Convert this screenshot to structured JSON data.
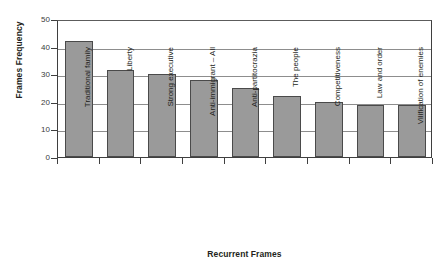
{
  "chart_data": {
    "type": "bar",
    "title": "",
    "xlabel": "Recurrent Frames",
    "ylabel": "Frames Frequency",
    "categories": [
      "Traditional family",
      "Liberty",
      "Strong executive",
      "Anti-immigrant – All",
      "Anti-partitocrazia",
      "The people",
      "Competitiveness",
      "Law and order",
      "Vilification of enemies"
    ],
    "values": [
      42,
      31.5,
      30,
      28,
      25,
      22,
      20,
      18.7,
      18.7
    ],
    "ylim": [
      0,
      50
    ],
    "yticks": [
      0,
      10,
      20,
      30,
      40,
      50
    ],
    "ytick_labels": [
      "0",
      "10",
      "20",
      "30",
      "40",
      "50"
    ],
    "grid": "horizontal",
    "legend": "none",
    "bar_color": "#9a9a9a",
    "bar_edge_color": "#4a4a4a",
    "axis_color": "#3f3f3f",
    "gridline_color": "#8d8d8d",
    "background": "#ffffff"
  }
}
